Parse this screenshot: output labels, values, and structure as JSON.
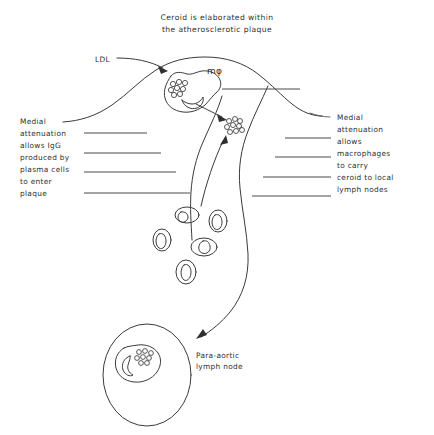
{
  "title": {
    "line1": "Ceroid is elaborated within",
    "line2": "the atherosclerotic plaque"
  },
  "labels": {
    "ldl": "LDL",
    "macrophage_symbol": "mφ",
    "lymph_node_line1": "Para-aortic",
    "lymph_node_line2": "lymph node"
  },
  "left_annotation": {
    "lines": [
      "Medial",
      "attenuation",
      "allows IgG",
      "produced by",
      "plasma cells",
      "to enter",
      "plaque"
    ]
  },
  "right_annotation": {
    "lines": [
      "Medial",
      "attenuation",
      "allows",
      "macrophages",
      "to carry",
      "ceroid to local",
      "lymph nodes"
    ]
  },
  "colors": {
    "ink": "#3a3a3a",
    "text": "#2f2f2f",
    "background": "#ffffff"
  }
}
